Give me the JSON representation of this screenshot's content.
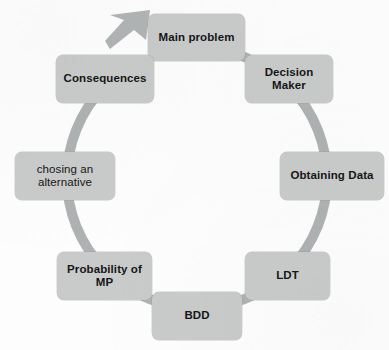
{
  "diagram": {
    "type": "cycle-diagram",
    "title": "",
    "direction": "clockwise",
    "center": {
      "x": 197,
      "y": 178
    },
    "ring": {
      "radius": 130,
      "band_width": 10,
      "color": "#aeb2b2"
    },
    "colors": {
      "node_fill": "#c9cbcb",
      "ring": "#aeb2b2",
      "connector": "#b4b8b8",
      "text": "#161616",
      "background": "#fdfdfd"
    },
    "arrow": {
      "name": "clockwise-arrowhead",
      "position": "top-left",
      "points_to": "Main problem"
    },
    "nodes": [
      {
        "id": "main-problem",
        "label": "Main problem",
        "lines": [
          "Main problem"
        ],
        "position": "top",
        "box": {
          "x": 148,
          "y": 14,
          "w": 97,
          "h": 47
        }
      },
      {
        "id": "decision-maker",
        "label": "Decision Maker",
        "lines": [
          "Decision",
          "Maker"
        ],
        "position": "top-right",
        "box": {
          "x": 245,
          "y": 55,
          "w": 88,
          "h": 48
        }
      },
      {
        "id": "obtaining-data",
        "label": "Obtaining Data",
        "lines": [
          "Obtaining Data"
        ],
        "position": "right",
        "box": {
          "x": 280,
          "y": 152,
          "w": 104,
          "h": 48
        }
      },
      {
        "id": "ldt",
        "label": "LDT",
        "lines": [
          "LDT"
        ],
        "position": "bottom-right",
        "box": {
          "x": 245,
          "y": 252,
          "w": 85,
          "h": 48
        }
      },
      {
        "id": "bdd",
        "label": "BDD",
        "lines": [
          "BDD"
        ],
        "position": "bottom",
        "box": {
          "x": 152,
          "y": 292,
          "w": 90,
          "h": 48
        }
      },
      {
        "id": "probability-of-mp",
        "label": "Probability of MP",
        "lines": [
          "Probability of",
          "MP"
        ],
        "position": "bottom-left",
        "box": {
          "x": 57,
          "y": 252,
          "w": 95,
          "h": 48
        }
      },
      {
        "id": "chosing-an-alternative",
        "label": "chosing an alternative",
        "lines": [
          "chosing an",
          "alternative"
        ],
        "position": "left",
        "box": {
          "x": 15,
          "y": 152,
          "w": 100,
          "h": 48
        }
      },
      {
        "id": "consequences",
        "label": "Consequences",
        "lines": [
          "Consequences"
        ],
        "position": "top-left",
        "box": {
          "x": 56,
          "y": 55,
          "w": 98,
          "h": 48
        }
      }
    ]
  }
}
